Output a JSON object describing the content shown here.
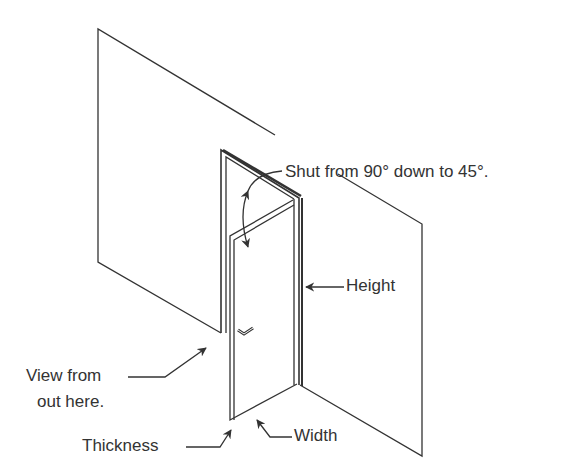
{
  "diagram": {
    "type": "isometric door illustration",
    "colors": {
      "line": "#333333",
      "background": "#ffffff"
    },
    "labels": {
      "angle": "Shut from 90° down to 45°.",
      "height": "Height",
      "view_line1": "View from",
      "view_line2": "out here.",
      "thickness": "Thickness",
      "width": "Width"
    },
    "icons": [
      "door-handle-icon",
      "arrow-icon",
      "double-headed-arc-arrow-icon"
    ]
  }
}
